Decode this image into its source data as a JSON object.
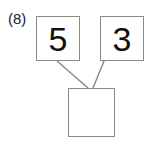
{
  "problem": {
    "number_label": "(8)",
    "top_left_value": "5",
    "top_right_value": "3",
    "bottom_value": ""
  },
  "colors": {
    "box_border": "#8a8a8a",
    "text": "#111111"
  }
}
